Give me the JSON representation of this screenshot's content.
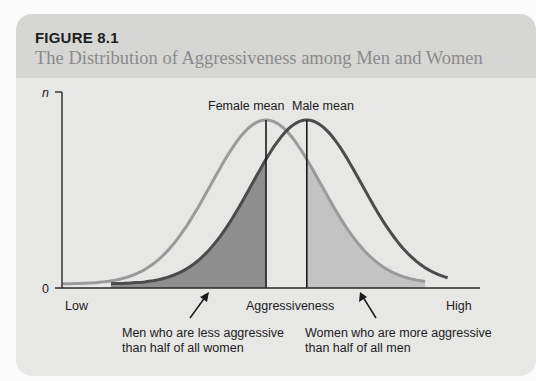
{
  "figure": {
    "label": "FIGURE 8.1",
    "title": "The Distribution of Aggressiveness among Men and Women"
  },
  "chart_data": {
    "type": "line",
    "title": "The Distribution of Aggressiveness among Men and Women",
    "xlabel": "Aggressiveness",
    "ylabel": "n",
    "x_tick_labels": [
      "Low",
      "High"
    ],
    "y_tick_labels": [
      "0",
      "n"
    ],
    "xlim": [
      0,
      1
    ],
    "ylim": [
      0,
      1
    ],
    "grid": false,
    "legend": "none",
    "series": [
      {
        "name": "Women",
        "distribution": "normal",
        "mean": 0.5,
        "sd": 0.135,
        "color": "#8f8f8f"
      },
      {
        "name": "Men",
        "distribution": "normal",
        "mean": 0.6,
        "sd": 0.135,
        "color": "#4a4a4a"
      }
    ],
    "reference_lines": [
      {
        "label": "Female mean",
        "x": 0.5
      },
      {
        "label": "Male mean",
        "x": 0.6
      }
    ],
    "shaded_regions": [
      {
        "series": "Men",
        "from": "start",
        "to": "Female mean",
        "color": "#8c8c8c"
      },
      {
        "series": "Women",
        "from": "Male mean",
        "to": "end",
        "color": "#bdbdbd"
      }
    ],
    "annotations": [
      {
        "text_lines": [
          "Men who are less aggressive",
          "than half of all women"
        ],
        "points_to": "Men shaded region"
      },
      {
        "text_lines": [
          "Women who are more aggressive",
          "than half of all men"
        ],
        "points_to": "Women shaded region"
      }
    ]
  },
  "colors": {
    "women_curve": "#9a9a9a",
    "men_curve": "#4b4b4b",
    "men_fill": "#8e8e8e",
    "women_fill": "#c3c3c3",
    "axis": "#2a2a2a"
  }
}
